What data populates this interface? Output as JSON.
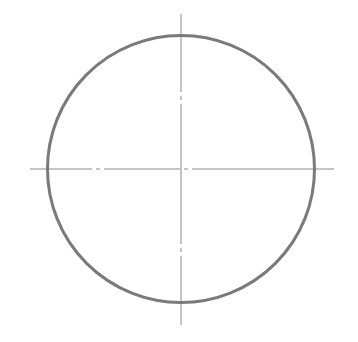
{
  "diagram": {
    "type": "circle-with-centerlines",
    "canvas": {
      "width": 358,
      "height": 342,
      "background": "#ffffff"
    },
    "circle": {
      "cx": 181,
      "cy": 169,
      "r": 133.5,
      "stroke": "#7a7a7a",
      "stroke_width": 3
    },
    "centerlines": {
      "stroke": "#8a8a8a",
      "stroke_width": 1,
      "horizontal": {
        "x1": 30,
        "x2": 334,
        "y": 169,
        "dasharray": "62 4 4 4 76 4 4 4 158"
      },
      "vertical": {
        "x": 181,
        "y1": 14,
        "y2": 325,
        "dasharray": "78 4 4 4 140 4 4 4 200"
      }
    }
  }
}
